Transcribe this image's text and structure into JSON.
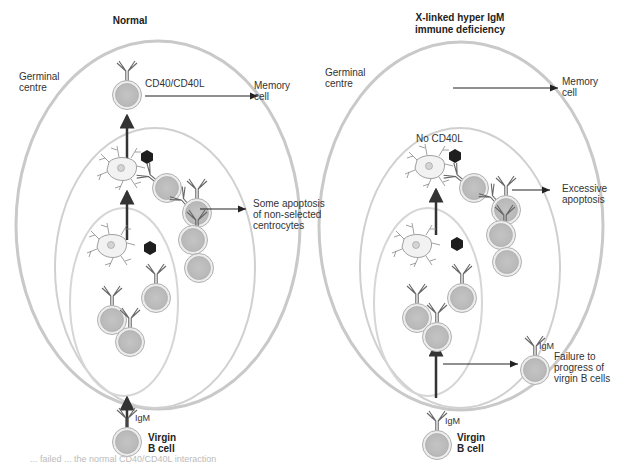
{
  "panels": [
    {
      "title": "Normal",
      "germinal_centre_label": "Germinal\ncentre",
      "interaction_label": "CD40/CD40L",
      "outcome_top": "Memory\ncell",
      "outcome_side": "Some apoptosis\nof non-selected\ncentrocytes",
      "receptor_label": "IgM",
      "virgin_label": "Virgin\nB cell"
    },
    {
      "title": "X-linked hyper IgM\nimmune deficiency",
      "germinal_centre_label": "Germinal\ncentre",
      "interaction_label": "No CD40L",
      "outcome_top": "Memory\ncell",
      "outcome_side": "Excessive\napoptosis",
      "failure_label": "Failure to\nprogress of\nvirgin B cells",
      "failure_receptor_label": "IgM",
      "receptor_label": "IgM",
      "virgin_label": "Virgin\nB cell"
    }
  ],
  "caption": "... failed ... the normal CD40/CD40L interaction",
  "colors": {
    "cell_fill": "#c8c8c8",
    "cell_ring": "#e2e2e2",
    "ellipse_stroke": "#bdbdbd",
    "arrow": "#333333",
    "fdc_nucleus": "#d0d0d0",
    "antigen": "#1e1e1e"
  }
}
